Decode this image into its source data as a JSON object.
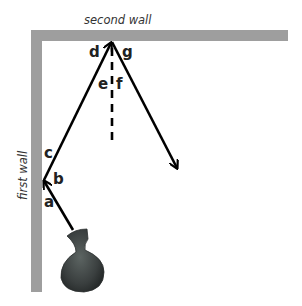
{
  "walls": {
    "first": {
      "label": "first wall"
    },
    "second": {
      "label": "second wall"
    },
    "color": "#9e9e9e"
  },
  "angle_labels": {
    "a": "a",
    "b": "b",
    "c": "c",
    "d": "d",
    "e": "e",
    "f": "f",
    "g": "g"
  },
  "colors": {
    "ray": "#000000",
    "vase": "#3a3f3f",
    "background": "#ffffff"
  },
  "objects": {
    "vase": "vase",
    "normal_line": "dashed normal line"
  }
}
